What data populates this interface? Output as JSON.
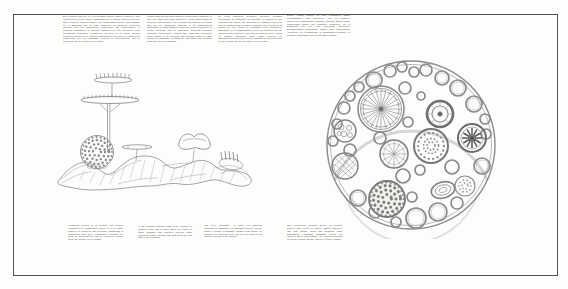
{
  "document": {
    "kind_label": "scanned book spread",
    "background_color": "#fdfdfc",
    "frame_color": "#4f4f4f",
    "ink_color": "#3e3e3e",
    "pencil_color": "#8b8b8b"
  },
  "text_blocks": {
    "top_left_nl": {
      "lang": "nl",
      "text": "Een dergelijk huis zou tot een bepaalde grootte kunnen uitgroeien, zich onderverdelen of met andere samensmelten tot grotere gehelen. Men zou grote gewelven kunnen vormen door parabolische spuiten van kunststof die in aanraking met de lucht opzwellen tot ballonnen. Uitdijende patronen van een onmiddellijke architectuur van transformaties, in gewenste dichtheden, in bekende richtingen en voor berekende duur. Wolkachtige gebouwen, voortdurend vloeiende en uit elkaar vallende structuren, zouden in de ochtend samenkomen en zich in de nacht weer verspreiden over het landschap, volgens de getijdenwetten van de netwerken die het nieuwe leven vraagt."
    },
    "top_center_en": {
      "lang": "en",
      "text": "Houses such as this would grow to certain sizes, subdivide or fuse into larger functional complexes. Great vaults would be produced with parabolic jets of plastic that balloon on contact with the air. Expanding patterns of an instantaneous architecture of transformation, grown into desired densities, in known directions and for calculated durations. Cloudlike buildings, continuously flowing and dissolving structures, would gather in the morning and disperse again at night across the landscape, following the tidal laws of the networks which the new life demands."
    },
    "top_right_fr": {
      "lang": "fr",
      "text": "De telles demeures pourraient atteindre certaines dimensions, se subdiviser ou fusionner en complexes aux fonctions plus vastes. On obtiendrait de grandes voûtes par des jets paraboliques de matière plastique qui se gonflent au contact de l'air. Motifs en expansion d'une architecture instantanée de la transformation, selon des densités voulues, des directions connues et des durées calculées. Des édifices en nuages, structures sans cesse fluentes, se rassembleraient au matin pour se disperser de nouveau dans la nuit, suivant les lois des marées des réseaux."
    },
    "right_page_de": {
      "lang": "de",
      "text": "Solche Häuser würden zu einer bestimmten Größe heranwachsen, sich unterteilen oder zu größeren Komplexen verschmelzen. Mächtige Gewölbe würden durch parabolische Düsen aus Kunststoff hergestellt, die in Berührung mit der Luft ballonartig aufquellen. Expansionsartig entstehende Muster einer unmittelbaren Architektur der Verwandlung, in gewachsenen Dichten, in bekannte Richtungen und für berechnete Dauer."
    },
    "bottom_left_nl": {
      "lang": "nl",
      "text": "Voorsteden zouden in de morgen zich kunnen verzamelen tot dichtbevolkte steden en in de nacht, wanneer de behoefte aan stedelijke uitwisseling is verminderd, zich weer verspreiden; patronen die aldus de getijdenwetten van de netwerken volgen, welke het nieuwe leven verlangt."
    },
    "bottom_center_en": {
      "lang": "en",
      "text": "In the morning suburbs might come together in crowded cities, and at night, when the desire for urban exchange has lessened, disperse again across the region; patterns that thus follow the tidal laws of the networks."
    },
    "bottom_right_fr": {
      "lang": "fr",
      "text": "Une étoile étincelante. Au matin, les banlieues pourraient se rassembler en immenses villes et, la nuit, quand le besoin d'échanges urbains s'est apaisé, se disperser de nouveau; selon les lois des marées des réseaux qu'exige la vie nouvelle."
    },
    "right_page_caption_de": {
      "lang": "de",
      "text": "Eine vielgliedrige, bewegte Dauer. Am Morgen könnten sich Vororte zu dichten Städten sammeln und sich nachts, wenn das Bedürfnis nach städtischem Austausch nachlässt, wieder an anderen Orten niederlassen; der Gezeitenordnung der Netze folgend, welche das neue Leben verlangt."
    }
  },
  "figures": {
    "left": {
      "name": "winged-structure-pencil-sketch"
    },
    "right": {
      "name": "circular-cluster-pencil-sketch"
    }
  }
}
